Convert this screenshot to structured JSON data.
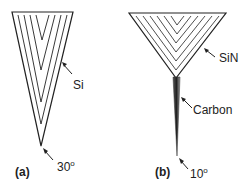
{
  "panels": [
    {
      "id": "a",
      "label": "(a)",
      "material_label": "Si",
      "angle_value": "30",
      "angle_unit": "o"
    },
    {
      "id": "b",
      "label": "(b)",
      "material_label": "SiN",
      "spike_label": "Carbon",
      "angle_value": "10",
      "angle_unit": "o"
    }
  ],
  "colors": {
    "line": "#222222",
    "background": "#ffffff",
    "spike_dark": "#333333",
    "spike_light": "#9a9a9a"
  }
}
